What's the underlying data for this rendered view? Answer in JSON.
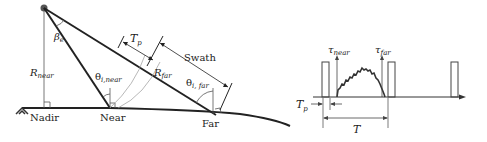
{
  "geometry": {
    "labels": {
      "beta": "β",
      "beta_sub": "e",
      "r_near": "R",
      "r_near_sub": "near",
      "r_far": "R",
      "r_far_sub": "far",
      "theta_near": "θ",
      "theta_near_sub": "i,near",
      "theta_far": "θ",
      "theta_far_sub": "i, far",
      "tp": "T",
      "tp_sub": "p",
      "swath": "Swath",
      "nadir": "Nadir",
      "near": "Near",
      "far": "Far"
    }
  },
  "timing": {
    "labels": {
      "tau_near": "τ",
      "tau_near_sub": "near",
      "tau_far": "τ",
      "tau_far_sub": "far",
      "tp": "T",
      "tp_sub": "p",
      "period": "T"
    }
  },
  "colors": {
    "line": "#222222",
    "thin": "#555555",
    "arc": "#999999"
  }
}
